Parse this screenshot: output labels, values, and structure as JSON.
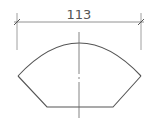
{
  "drawing": {
    "type": "technical-drawing",
    "dimension": {
      "label": "113",
      "orientation": "horizontal",
      "line_y": 22,
      "x1": 17,
      "x2": 141
    },
    "colors": {
      "outline": "#555555",
      "dimension": "#777777",
      "centerline": "#666666",
      "background": "#ffffff"
    }
  }
}
